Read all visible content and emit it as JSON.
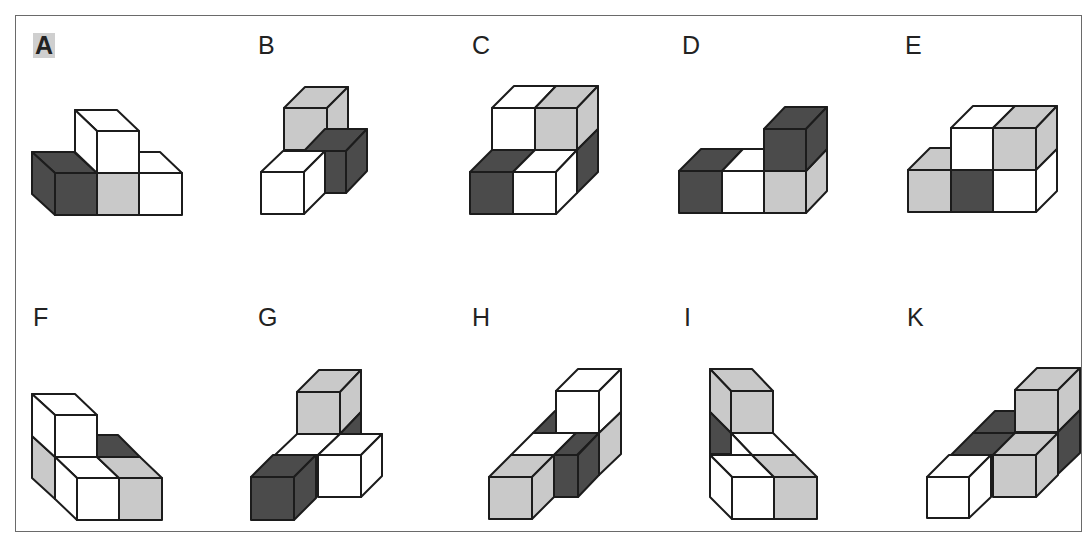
{
  "colors": {
    "dark": "#4b4b4b",
    "gray": "#c9c9c9",
    "white": "#ffffff",
    "stroke": "#1c1c1c",
    "frame": "#6a6a6a",
    "highlight": "#cfcfcf"
  },
  "figures": [
    {
      "id": "A",
      "label": "A",
      "highlighted": true,
      "label_pos": [
        33,
        33
      ],
      "faces": [
        [
          "dark",
          "32,152 74,152 97,173 55,173"
        ],
        [
          "dark",
          "32,152 55,173 55,215 32,194"
        ],
        [
          "dark",
          "55,173 97,173 97,215 55,215"
        ],
        [
          "gray",
          "97,173 139,173 139,215 97,215"
        ],
        [
          "white",
          "139,173 117,152 160,152 182,173"
        ],
        [
          "white",
          "139,173 182,173 182,215 139,215"
        ],
        [
          "white",
          "75,110 117,110 139,131 97,131"
        ],
        [
          "white",
          "75,110 97,131 97,173 75,152"
        ],
        [
          "white",
          "97,131 139,131 139,173 97,173"
        ]
      ]
    },
    {
      "id": "B",
      "label": "B",
      "highlighted": false,
      "label_pos": [
        258,
        33
      ],
      "faces": [
        [
          "gray",
          "284,108 305,87 348,87 327,108"
        ],
        [
          "gray",
          "327,108 348,87 348,129 327,150"
        ],
        [
          "gray",
          "284,108 327,108 327,150 284,150"
        ],
        [
          "dark",
          "304,151 325,129 367,129 346,151"
        ],
        [
          "dark",
          "346,151 367,129 367,171 346,193"
        ],
        [
          "dark",
          "304,151 346,151 346,193 304,193"
        ],
        [
          "white",
          "261,172 283,151 325,151 304,172"
        ],
        [
          "white",
          "304,172 325,151 325,193 304,214"
        ],
        [
          "white",
          "261,172 304,172 304,214 261,214"
        ]
      ]
    },
    {
      "id": "C",
      "label": "C",
      "highlighted": false,
      "label_pos": [
        472,
        33
      ],
      "faces": [
        [
          "white",
          "492,108 514,86 556,86 535,108"
        ],
        [
          "gray",
          "535,108 556,86 598,86 577,108"
        ],
        [
          "gray",
          "577,108 598,86 598,129 577,150"
        ],
        [
          "white",
          "492,108 535,108 535,150 492,150"
        ],
        [
          "gray",
          "535,108 577,108 577,150 535,150"
        ],
        [
          "dark",
          "598,129 598,172 577,193 577,150"
        ],
        [
          "dark",
          "470,172 492,150 535,150 513,172"
        ],
        [
          "white",
          "513,172 535,150 577,150 556,172"
        ],
        [
          "white",
          "556,172 577,150 577,193 556,214"
        ],
        [
          "dark",
          "470,172 513,172 513,214 470,214"
        ],
        [
          "white",
          "513,172 556,172 556,214 513,214"
        ]
      ]
    },
    {
      "id": "D",
      "label": "D",
      "highlighted": false,
      "label_pos": [
        682,
        33
      ],
      "faces": [
        [
          "dark",
          "679,171 701,149 743,149 722,171"
        ],
        [
          "white",
          "722,171 743,149 764,149 764,171"
        ],
        [
          "dark",
          "679,171 722,171 722,213 679,213"
        ],
        [
          "white",
          "722,171 764,171 764,213 722,213"
        ],
        [
          "gray",
          "764,171 806,171 806,213 764,213"
        ],
        [
          "gray",
          "806,171 827,149 827,191 806,213"
        ],
        [
          "dark",
          "764,129 785,107 827,107 806,129"
        ],
        [
          "dark",
          "806,129 827,107 827,149 806,171"
        ],
        [
          "dark",
          "764,129 806,129 806,171 764,171"
        ]
      ]
    },
    {
      "id": "E",
      "label": "E",
      "highlighted": false,
      "label_pos": [
        905,
        33
      ],
      "faces": [
        [
          "gray",
          "908,170 930,148 951,148 951,170"
        ],
        [
          "white",
          "951,128 973,106 1015,106 993,128"
        ],
        [
          "gray",
          "993,128 1015,106 1057,106 1036,128"
        ],
        [
          "gray",
          "1036,128 1057,106 1057,149 1036,170"
        ],
        [
          "white",
          "951,128 993,128 993,170 951,170"
        ],
        [
          "gray",
          "993,128 1036,128 1036,170 993,170"
        ],
        [
          "white",
          "1036,170 1057,149 1057,191 1036,212"
        ],
        [
          "gray",
          "908,170 951,170 951,212 908,212"
        ],
        [
          "dark",
          "951,170 993,170 993,212 951,212"
        ],
        [
          "white",
          "993,170 1036,170 1036,212 993,212"
        ]
      ]
    },
    {
      "id": "F",
      "label": "F",
      "highlighted": false,
      "label_pos": [
        33,
        305
      ],
      "faces": [
        [
          "dark",
          "97,435 118,435 140,457 97,457"
        ],
        [
          "white",
          "55,457 97,457 119,478 77,478"
        ],
        [
          "gray",
          "97,457 140,457 162,478 119,478"
        ],
        [
          "gray",
          "32,436 55,457 55,499 32,478"
        ],
        [
          "white",
          "55,457 77,478 77,520 55,499"
        ],
        [
          "white",
          "77,478 119,478 119,520 77,520"
        ],
        [
          "gray",
          "119,478 162,478 162,520 119,520"
        ],
        [
          "white",
          "32,394 75,394 97,415 55,415"
        ],
        [
          "white",
          "32,394 55,415 55,457 32,436"
        ],
        [
          "white",
          "55,415 97,415 97,457 55,457"
        ]
      ]
    },
    {
      "id": "G",
      "label": "G",
      "highlighted": false,
      "label_pos": [
        258,
        305
      ],
      "faces": [
        [
          "gray",
          "297,392 319,370 361,370 340,392"
        ],
        [
          "gray",
          "340,392 361,370 361,412 340,434"
        ],
        [
          "dark",
          "340,434 361,412 361,434"
        ],
        [
          "gray",
          "297,392 340,392 340,434 297,434"
        ],
        [
          "white",
          "275,455 297,434 340,434 318,455"
        ],
        [
          "white",
          "318,455 340,434 382,434 361,455"
        ],
        [
          "white",
          "361,455 382,434 382,476 361,497"
        ],
        [
          "white",
          "318,455 361,455 361,497 318,497"
        ],
        [
          "dark",
          "251,477 273,455 316,455 294,477"
        ],
        [
          "dark",
          "294,477 316,455 316,498 294,520"
        ],
        [
          "dark",
          "251,477 294,477 294,520 251,520"
        ]
      ]
    },
    {
      "id": "H",
      "label": "H",
      "highlighted": false,
      "label_pos": [
        472,
        305
      ],
      "faces": [
        [
          "dark",
          "533,433 555,411 558,411 558,433"
        ],
        [
          "white",
          "556,391 578,369 621,369 599,391"
        ],
        [
          "white",
          "599,391 621,369 621,412 599,433"
        ],
        [
          "white",
          "556,391 599,391 599,433 556,433"
        ],
        [
          "gray",
          "599,433 621,412 621,454 599,475"
        ],
        [
          "white",
          "511,455 533,433 576,433 554,455"
        ],
        [
          "dark",
          "554,455 576,433 599,433 577,455"
        ],
        [
          "dark",
          "536,455 578,455 578,497 536,497"
        ],
        [
          "dark",
          "578,455 599,433 599,475 578,497"
        ],
        [
          "gray",
          "489,477 511,455 554,455 532,477"
        ],
        [
          "gray",
          "532,477 554,455 554,497 532,519"
        ],
        [
          "gray",
          "489,477 532,477 532,519 489,519"
        ]
      ]
    },
    {
      "id": "I",
      "label": "I",
      "highlighted": false,
      "label_pos": [
        684,
        305
      ],
      "faces": [
        [
          "gray",
          "710,369 752,369 773,391 731,391"
        ],
        [
          "gray",
          "710,369 731,391 731,433 710,412"
        ],
        [
          "gray",
          "731,391 773,391 773,433 731,433"
        ],
        [
          "dark",
          "710,412 731,433 731,454 710,454"
        ],
        [
          "white",
          "731,433 773,433 795,455 752,455"
        ],
        [
          "white",
          "731,433 752,455 731,455"
        ],
        [
          "white",
          "710,455 752,455 774,477 732,477"
        ],
        [
          "gray",
          "752,455 795,455 817,477 774,477"
        ],
        [
          "white",
          "710,455 732,477 732,519 710,497"
        ],
        [
          "white",
          "732,477 774,477 774,519 732,519"
        ],
        [
          "gray",
          "774,477 817,477 817,519 774,519"
        ]
      ]
    },
    {
      "id": "K",
      "label": "K",
      "highlighted": false,
      "label_pos": [
        907,
        305
      ],
      "faces": [
        [
          "dark",
          "973,433 995,411 1015,411 1015,433"
        ],
        [
          "gray",
          "1015,390 1037,368 1080,368 1058,390"
        ],
        [
          "gray",
          "1058,390 1080,368 1080,410 1058,432"
        ],
        [
          "gray",
          "1015,390 1058,390 1058,432 1015,432"
        ],
        [
          "dark",
          "1058,432 1080,410 1080,453 1058,474"
        ],
        [
          "dark",
          "951,455 973,433 1015,433 993,455"
        ],
        [
          "gray",
          "993,455 1015,433 1058,433 1036,455"
        ],
        [
          "gray",
          "1036,455 1058,433 1058,475 1036,497"
        ],
        [
          "gray",
          "993,455 1036,455 1036,497 993,497"
        ],
        [
          "white",
          "927,477 949,455 991,455 969,477"
        ],
        [
          "white",
          "969,477 991,455 991,497 969,518"
        ],
        [
          "white",
          "927,477 969,477 969,518 927,518"
        ]
      ]
    }
  ]
}
